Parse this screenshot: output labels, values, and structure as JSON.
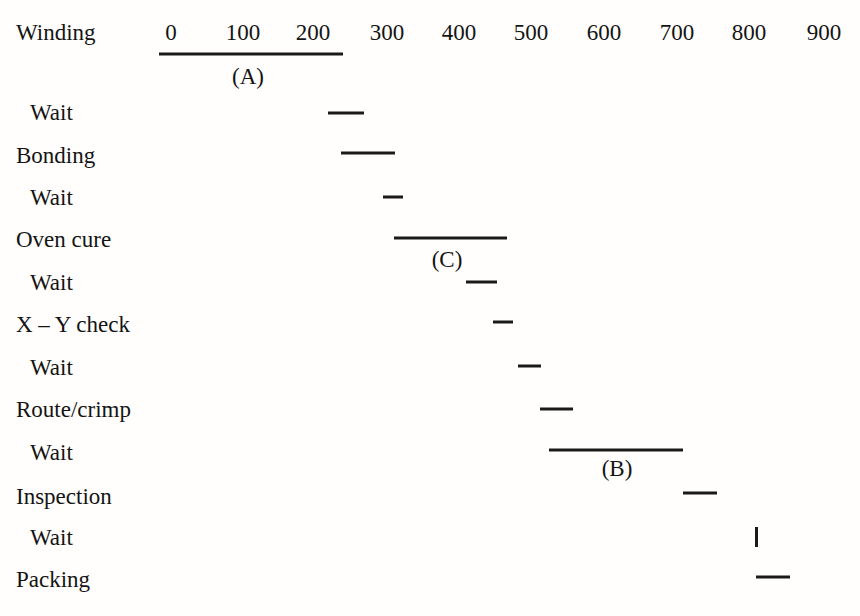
{
  "chart_data": {
    "type": "bar",
    "chart_style": "gantt",
    "title": "",
    "xlabel": "",
    "ylabel": "",
    "xlim": [
      0,
      950
    ],
    "x_ticks": [
      0,
      100,
      200,
      300,
      400,
      500,
      600,
      700,
      800,
      900
    ],
    "x_tick_labels": [
      "0",
      "100",
      "200",
      "300",
      "400",
      "500",
      "600",
      "700",
      "800",
      "900"
    ],
    "grid": false,
    "legend": "none",
    "axis_position": "top",
    "axis_span": [
      0,
      255
    ],
    "bar_color": "#1a1a1a",
    "categories": [
      "Winding",
      "Wait",
      "Bonding",
      "Wait",
      "Oven cure",
      "Wait",
      "X – Y check",
      "Wait",
      "Route/crimp",
      "Wait",
      "Inspection",
      "Wait",
      "Packing"
    ],
    "tasks": [
      {
        "label": "Winding",
        "indent": false,
        "start": 0,
        "end": 255,
        "row": 0,
        "y": 32,
        "bar_y": 54,
        "bar_x0": 159,
        "bar_x1": 343
      },
      {
        "label": "Wait",
        "indent": true,
        "start": 235,
        "end": 285,
        "row": 1,
        "y": 112,
        "bar_y": 113,
        "bar_x0": 328,
        "bar_x1": 364
      },
      {
        "label": "Bonding",
        "indent": false,
        "start": 253,
        "end": 328,
        "row": 2,
        "y": 155,
        "bar_y": 153,
        "bar_x0": 341,
        "bar_x1": 395
      },
      {
        "label": "Wait",
        "indent": true,
        "start": 310,
        "end": 338,
        "row": 3,
        "y": 197,
        "bar_y": 197,
        "bar_x0": 383,
        "bar_x1": 403
      },
      {
        "label": "Oven cure",
        "indent": false,
        "start": 325,
        "end": 482,
        "row": 4,
        "y": 239,
        "bar_y": 238,
        "bar_x0": 394,
        "bar_x1": 507
      },
      {
        "label": "Wait",
        "indent": true,
        "start": 425,
        "end": 468,
        "row": 5,
        "y": 282,
        "bar_y": 282,
        "bar_x0": 466,
        "bar_x1": 497
      },
      {
        "label": "X – Y check",
        "indent": false,
        "start": 462,
        "end": 490,
        "row": 6,
        "y": 324,
        "bar_y": 322,
        "bar_x0": 493,
        "bar_x1": 513
      },
      {
        "label": "Wait",
        "indent": true,
        "start": 497,
        "end": 528,
        "row": 7,
        "y": 367,
        "bar_y": 366,
        "bar_x0": 518,
        "bar_x1": 541
      },
      {
        "label": "Route/crimp",
        "indent": false,
        "start": 527,
        "end": 572,
        "row": 8,
        "y": 409,
        "bar_y": 409,
        "bar_x0": 540,
        "bar_x1": 573
      },
      {
        "label": "Wait",
        "indent": true,
        "start": 540,
        "end": 725,
        "row": 9,
        "y": 452,
        "bar_y": 450,
        "bar_x0": 549,
        "bar_x1": 683
      },
      {
        "label": "Inspection",
        "indent": false,
        "start": 712,
        "end": 760,
        "row": 10,
        "y": 496,
        "bar_y": 493,
        "bar_x0": 683,
        "bar_x1": 717
      },
      {
        "label": "Wait",
        "indent": true,
        "start": 815,
        "end": 818,
        "row": 11,
        "y": 537,
        "bar_y": 537,
        "bar_x0": 755,
        "bar_x1": 758
      },
      {
        "label": "Packing",
        "indent": false,
        "start": 813,
        "end": 860,
        "row": 12,
        "y": 579,
        "bar_y": 577,
        "bar_x0": 756,
        "bar_x1": 790
      }
    ],
    "annotations": [
      {
        "text": "(A)",
        "x": 248,
        "y": 76,
        "refers_to": "Winding"
      },
      {
        "text": "(C)",
        "x": 447,
        "y": 259,
        "refers_to": "Oven cure"
      },
      {
        "text": "(B)",
        "x": 617,
        "y": 468,
        "refers_to": "Wait after Route/crimp"
      }
    ],
    "tick_positions_px": [
      171,
      243,
      313,
      387,
      459,
      531,
      604,
      677,
      749,
      824
    ]
  }
}
